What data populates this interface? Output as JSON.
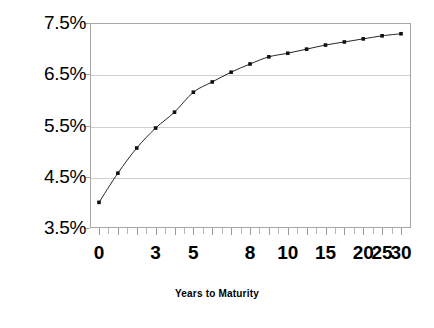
{
  "chart_data": {
    "type": "line",
    "title": "",
    "subtitle": "",
    "xlabel": "Years to Maturity",
    "ylabel": "",
    "x": [
      0,
      1,
      2,
      3,
      4,
      5,
      6,
      7,
      8,
      9,
      10,
      12,
      15,
      18,
      20,
      25,
      30
    ],
    "values": [
      4.0,
      4.57,
      5.06,
      5.45,
      5.76,
      6.15,
      6.35,
      6.54,
      6.7,
      6.84,
      6.91,
      6.99,
      7.07,
      7.13,
      7.19,
      7.25,
      7.29
    ],
    "series": [
      {
        "name": "Yield",
        "values": [
          4.0,
          4.57,
          5.06,
          5.45,
          5.76,
          6.15,
          6.35,
          6.54,
          6.7,
          6.84,
          6.91,
          6.99,
          7.07,
          7.13,
          7.19,
          7.25,
          7.29
        ]
      }
    ],
    "ylim": [
      3.5,
      7.5
    ],
    "ytick_labels": [
      "7.5%",
      "6.5%",
      "5.5%",
      "4.5%",
      "3.5%"
    ],
    "ytick_values": [
      7.5,
      6.5,
      5.5,
      4.5,
      3.5
    ],
    "xtick_labels": [
      "0",
      "3",
      "5",
      "8",
      "10",
      "15",
      "20",
      "25",
      "30"
    ],
    "xtick_index": [
      0,
      3,
      5,
      8,
      10,
      12,
      14,
      15,
      16
    ],
    "grid": true,
    "grid_axis": "y",
    "legend": "none",
    "marker": "square",
    "line_color": "#262626",
    "marker_color": "#101010",
    "grid_color": "#cfcfcf",
    "frame_color": "#a6a6a6",
    "background": "#ffffff",
    "annotations": []
  },
  "axis": {
    "x_title": "Years to Maturity"
  }
}
